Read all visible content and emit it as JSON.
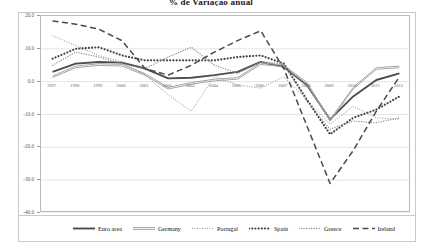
{
  "chart_data": {
    "type": "line",
    "title": "% de Variação anual",
    "xlabel": "",
    "ylabel": "",
    "ylim": [
      -40.0,
      20.0
    ],
    "yticks": [
      "20.0",
      "10.0",
      "0.0",
      "-10.0",
      "-20.0",
      "-30.0",
      "-40.0"
    ],
    "ytick_values": [
      20.0,
      10.0,
      0.0,
      -10.0,
      -20.0,
      -30.0,
      -40.0
    ],
    "grid": true,
    "legend_position": "bottom",
    "categories": [
      "1997",
      "1998",
      "1999",
      "2000",
      "2001",
      "2002",
      "2003",
      "2004",
      "2005",
      "2006",
      "2007",
      "2008",
      "2009",
      "2010",
      "2011",
      "2012"
    ],
    "x": [
      1997,
      1998,
      1999,
      2000,
      2001,
      2002,
      2003,
      2004,
      2005,
      2006,
      2007,
      2008,
      2009,
      2010,
      2011,
      2012
    ],
    "series": [
      {
        "name": "Euro area",
        "style": "solid-thick",
        "color": "#4d4d4d",
        "values": [
          3.0,
          5.5,
          6.0,
          5.8,
          4.0,
          1.0,
          1.2,
          2.0,
          3.0,
          6.0,
          4.5,
          -1.0,
          -11.5,
          -4.5,
          0.5,
          2.5
        ]
      },
      {
        "name": "Germany",
        "style": "solid-thin-double",
        "color": "#a6a6a6",
        "values": [
          1.5,
          4.5,
          5.2,
          5.0,
          2.2,
          -2.0,
          -0.5,
          0.5,
          1.0,
          5.5,
          4.8,
          -0.5,
          -11.8,
          -2.0,
          4.0,
          4.5
        ]
      },
      {
        "name": "Portugal",
        "style": "fine-dotted",
        "color": "#7a7a7a",
        "values": [
          14.0,
          11.0,
          8.0,
          6.0,
          2.0,
          -4.0,
          -9.0,
          1.5,
          -1.0,
          -2.0,
          1.5,
          -5.5,
          -13.0,
          -7.5,
          -11.0,
          -11.5
        ]
      },
      {
        "name": "Spain",
        "style": "round-dots",
        "color": "#3f3f3f",
        "values": [
          7.0,
          10.0,
          10.5,
          8.0,
          6.5,
          6.5,
          6.5,
          6.5,
          7.5,
          8.0,
          5.5,
          -5.5,
          -16.0,
          -11.0,
          -8.5,
          -4.5
        ]
      },
      {
        "name": "Greece",
        "style": "small-dots",
        "color": "#8c8c8c",
        "values": [
          5.0,
          9.0,
          7.5,
          5.5,
          4.0,
          7.5,
          10.5,
          5.0,
          2.5,
          6.0,
          5.5,
          -6.0,
          -14.5,
          -12.0,
          -12.5,
          -11.0
        ]
      },
      {
        "name": "Ireland",
        "style": "long-dash",
        "color": "#4a4a4a",
        "values": [
          18.5,
          17.5,
          16.0,
          12.5,
          4.0,
          2.0,
          5.0,
          9.0,
          12.5,
          15.5,
          4.0,
          -13.5,
          -31.0,
          -21.0,
          -9.0,
          1.5
        ]
      }
    ]
  },
  "axis": {
    "x_labels": [
      "1997",
      "1998",
      "1999",
      "2000",
      "2001",
      "2002",
      "2003",
      "2004",
      "2005",
      "2006",
      "2007",
      "2008",
      "2009",
      "2010",
      "2011",
      "2012"
    ],
    "y_labels": [
      "20.0",
      "10.0",
      "0.0",
      "-10.0",
      "-20.0",
      "-30.0",
      "-40.0"
    ]
  }
}
